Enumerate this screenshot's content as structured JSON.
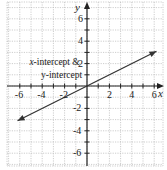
{
  "chart_data": {
    "type": "line",
    "title": "",
    "xlabel": "x",
    "ylabel": "y",
    "xlim": [
      -7,
      7
    ],
    "ylim": [
      -7,
      7
    ],
    "grid": true,
    "x_ticks": [
      -6,
      -4,
      -2,
      2,
      4,
      6
    ],
    "y_ticks": [
      6,
      4,
      2,
      -2,
      -4,
      -6
    ],
    "x_tick_labels": [
      "-6",
      "-4",
      "-2",
      "2",
      "4",
      "6"
    ],
    "y_tick_labels": [
      "6",
      "4",
      "2",
      "-2",
      "-4",
      "-6"
    ],
    "series": [
      {
        "name": "line through origin",
        "equation": "y = x/2",
        "x": [
          -6.2,
          0,
          6.2
        ],
        "y": [
          -3.1,
          0,
          3.1
        ],
        "arrows_both_ends": true
      }
    ],
    "annotations": [
      {
        "text_line1": "x-intercept & 2",
        "text_line1_italic_part": "x",
        "text_line2": "y-intercept",
        "points_to": [
          0,
          0
        ]
      }
    ]
  },
  "labels": {
    "x_axis": "x",
    "y_axis": "y",
    "annotation_line1_italic": "x",
    "annotation_line1_rest": "-intercept &",
    "annotation_line2": "y-intercept"
  },
  "colors": {
    "axis": "#222222",
    "grid": "#b8b8b8",
    "line": "#333333",
    "text": "#222222"
  }
}
